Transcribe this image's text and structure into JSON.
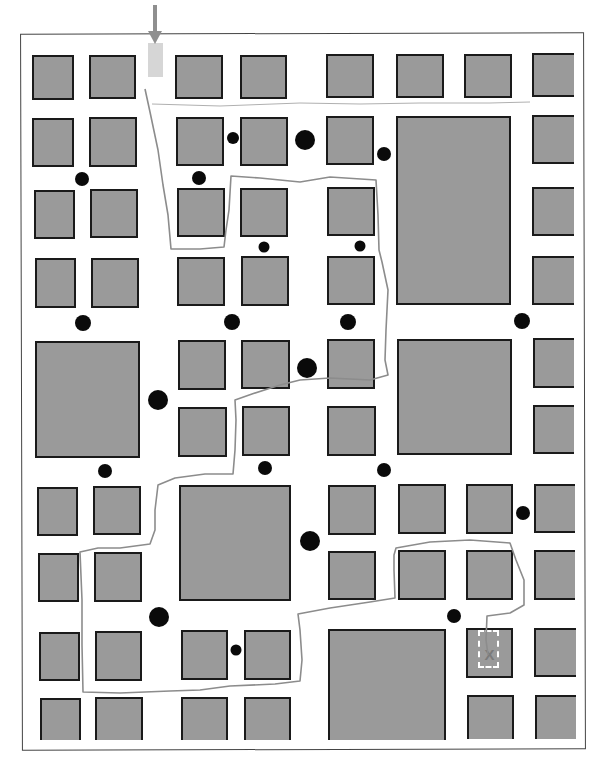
{
  "colors": {
    "block_fill": "#9a9a9a",
    "block_border": "#1a1a1a",
    "path": "#8c8c8c",
    "arrow": "#8f8f8f",
    "start_marker": "#d6d6d6",
    "dot": "#0a0a0a",
    "goal_box": "#ffffff"
  },
  "start": {
    "arrow": {
      "x": 155,
      "y_top": 5,
      "y_tip": 44
    },
    "marker": {
      "x": 148,
      "y": 43,
      "w": 15,
      "h": 34
    },
    "icon": "down-arrow-icon"
  },
  "goal": {
    "label": "X",
    "box": {
      "x": 478,
      "y": 630,
      "w": 21,
      "h": 38
    },
    "icon": "x-mark-icon"
  },
  "blocks": [
    {
      "x": 32,
      "y": 55,
      "w": 42,
      "h": 45
    },
    {
      "x": 89,
      "y": 55,
      "w": 47,
      "h": 44
    },
    {
      "x": 175,
      "y": 55,
      "w": 48,
      "h": 44
    },
    {
      "x": 240,
      "y": 55,
      "w": 47,
      "h": 44
    },
    {
      "x": 326,
      "y": 54,
      "w": 48,
      "h": 44
    },
    {
      "x": 396,
      "y": 54,
      "w": 48,
      "h": 44
    },
    {
      "x": 464,
      "y": 54,
      "w": 48,
      "h": 44
    },
    {
      "x": 532,
      "y": 53,
      "w": 42,
      "h": 44
    },
    {
      "x": 32,
      "y": 118,
      "w": 42,
      "h": 49
    },
    {
      "x": 89,
      "y": 117,
      "w": 48,
      "h": 50
    },
    {
      "x": 176,
      "y": 117,
      "w": 48,
      "h": 49
    },
    {
      "x": 240,
      "y": 117,
      "w": 48,
      "h": 49
    },
    {
      "x": 326,
      "y": 116,
      "w": 48,
      "h": 49
    },
    {
      "x": 396,
      "y": 116,
      "w": 115,
      "h": 189
    },
    {
      "x": 532,
      "y": 115,
      "w": 42,
      "h": 49
    },
    {
      "x": 34,
      "y": 190,
      "w": 41,
      "h": 49
    },
    {
      "x": 90,
      "y": 189,
      "w": 48,
      "h": 49
    },
    {
      "x": 177,
      "y": 188,
      "w": 48,
      "h": 49
    },
    {
      "x": 240,
      "y": 188,
      "w": 48,
      "h": 49
    },
    {
      "x": 327,
      "y": 187,
      "w": 48,
      "h": 49
    },
    {
      "x": 532,
      "y": 187,
      "w": 42,
      "h": 49
    },
    {
      "x": 35,
      "y": 258,
      "w": 41,
      "h": 50
    },
    {
      "x": 91,
      "y": 258,
      "w": 48,
      "h": 50
    },
    {
      "x": 177,
      "y": 257,
      "w": 48,
      "h": 49
    },
    {
      "x": 241,
      "y": 256,
      "w": 48,
      "h": 50
    },
    {
      "x": 327,
      "y": 256,
      "w": 48,
      "h": 49
    },
    {
      "x": 532,
      "y": 256,
      "w": 42,
      "h": 49
    },
    {
      "x": 35,
      "y": 341,
      "w": 105,
      "h": 117
    },
    {
      "x": 178,
      "y": 340,
      "w": 48,
      "h": 50
    },
    {
      "x": 241,
      "y": 340,
      "w": 49,
      "h": 49
    },
    {
      "x": 327,
      "y": 339,
      "w": 48,
      "h": 50
    },
    {
      "x": 397,
      "y": 339,
      "w": 115,
      "h": 116
    },
    {
      "x": 533,
      "y": 338,
      "w": 41,
      "h": 50
    },
    {
      "x": 178,
      "y": 407,
      "w": 49,
      "h": 50
    },
    {
      "x": 242,
      "y": 406,
      "w": 48,
      "h": 50
    },
    {
      "x": 327,
      "y": 406,
      "w": 49,
      "h": 50
    },
    {
      "x": 533,
      "y": 405,
      "w": 41,
      "h": 49
    },
    {
      "x": 37,
      "y": 487,
      "w": 41,
      "h": 49
    },
    {
      "x": 93,
      "y": 486,
      "w": 48,
      "h": 49
    },
    {
      "x": 179,
      "y": 485,
      "w": 112,
      "h": 116
    },
    {
      "x": 328,
      "y": 485,
      "w": 48,
      "h": 50
    },
    {
      "x": 398,
      "y": 484,
      "w": 48,
      "h": 50
    },
    {
      "x": 466,
      "y": 484,
      "w": 47,
      "h": 50
    },
    {
      "x": 534,
      "y": 484,
      "w": 41,
      "h": 49
    },
    {
      "x": 38,
      "y": 553,
      "w": 41,
      "h": 49
    },
    {
      "x": 94,
      "y": 552,
      "w": 48,
      "h": 50
    },
    {
      "x": 328,
      "y": 551,
      "w": 48,
      "h": 49
    },
    {
      "x": 398,
      "y": 550,
      "w": 48,
      "h": 50
    },
    {
      "x": 466,
      "y": 550,
      "w": 47,
      "h": 50
    },
    {
      "x": 534,
      "y": 550,
      "w": 41,
      "h": 50
    },
    {
      "x": 39,
      "y": 632,
      "w": 41,
      "h": 49
    },
    {
      "x": 95,
      "y": 631,
      "w": 47,
      "h": 50
    },
    {
      "x": 181,
      "y": 630,
      "w": 47,
      "h": 50
    },
    {
      "x": 244,
      "y": 630,
      "w": 47,
      "h": 50
    },
    {
      "x": 328,
      "y": 629,
      "w": 118,
      "h": 111
    },
    {
      "x": 466,
      "y": 628,
      "w": 47,
      "h": 50
    },
    {
      "x": 534,
      "y": 628,
      "w": 42,
      "h": 49
    },
    {
      "x": 40,
      "y": 698,
      "w": 41,
      "h": 42
    },
    {
      "x": 95,
      "y": 697,
      "w": 48,
      "h": 43
    },
    {
      "x": 181,
      "y": 697,
      "w": 47,
      "h": 43
    },
    {
      "x": 244,
      "y": 697,
      "w": 47,
      "h": 43
    },
    {
      "x": 467,
      "y": 695,
      "w": 47,
      "h": 44
    },
    {
      "x": 535,
      "y": 695,
      "w": 41,
      "h": 44
    }
  ],
  "dots": [
    {
      "x": 233,
      "y": 138,
      "r": 6
    },
    {
      "x": 305,
      "y": 140,
      "r": 10
    },
    {
      "x": 384,
      "y": 154,
      "r": 7
    },
    {
      "x": 82,
      "y": 179,
      "r": 7
    },
    {
      "x": 199,
      "y": 178,
      "r": 7
    },
    {
      "x": 264,
      "y": 247,
      "r": 5.5
    },
    {
      "x": 360,
      "y": 246,
      "r": 5.5
    },
    {
      "x": 83,
      "y": 323,
      "r": 8
    },
    {
      "x": 232,
      "y": 322,
      "r": 8
    },
    {
      "x": 348,
      "y": 322,
      "r": 8
    },
    {
      "x": 522,
      "y": 321,
      "r": 8
    },
    {
      "x": 307,
      "y": 368,
      "r": 10
    },
    {
      "x": 158,
      "y": 400,
      "r": 10
    },
    {
      "x": 105,
      "y": 471,
      "r": 7
    },
    {
      "x": 265,
      "y": 468,
      "r": 7
    },
    {
      "x": 384,
      "y": 470,
      "r": 7
    },
    {
      "x": 523,
      "y": 513,
      "r": 7
    },
    {
      "x": 310,
      "y": 541,
      "r": 10
    },
    {
      "x": 159,
      "y": 617,
      "r": 10
    },
    {
      "x": 454,
      "y": 616,
      "r": 7
    },
    {
      "x": 236,
      "y": 650,
      "r": 5.5
    }
  ],
  "path_points": [
    [
      145,
      89
    ],
    [
      150,
      112
    ],
    [
      158,
      150
    ],
    [
      163,
      185
    ],
    [
      168,
      215
    ],
    [
      171,
      249
    ],
    [
      200,
      249
    ],
    [
      224,
      247
    ],
    [
      226,
      230
    ],
    [
      229,
      210
    ],
    [
      231,
      176
    ],
    [
      260,
      178
    ],
    [
      300,
      182
    ],
    [
      330,
      177
    ],
    [
      376,
      180
    ],
    [
      378,
      215
    ],
    [
      379,
      250
    ],
    [
      382,
      262
    ],
    [
      388,
      290
    ],
    [
      386,
      330
    ],
    [
      385,
      360
    ],
    [
      388,
      375
    ],
    [
      370,
      380
    ],
    [
      330,
      378
    ],
    [
      300,
      380
    ],
    [
      280,
      385
    ],
    [
      252,
      394
    ],
    [
      235,
      400
    ],
    [
      236,
      420
    ],
    [
      235,
      450
    ],
    [
      233,
      474
    ],
    [
      205,
      474
    ],
    [
      175,
      478
    ],
    [
      158,
      485
    ],
    [
      155,
      510
    ],
    [
      155,
      530
    ],
    [
      150,
      544
    ],
    [
      120,
      548
    ],
    [
      98,
      548
    ],
    [
      80,
      552
    ],
    [
      82,
      600
    ],
    [
      82,
      645
    ],
    [
      83,
      692
    ],
    [
      120,
      693
    ],
    [
      170,
      691
    ],
    [
      200,
      690
    ],
    [
      230,
      686
    ],
    [
      275,
      684
    ],
    [
      300,
      681
    ],
    [
      302,
      660
    ],
    [
      300,
      630
    ],
    [
      298,
      614
    ],
    [
      330,
      608
    ],
    [
      370,
      602
    ],
    [
      395,
      598
    ],
    [
      394,
      570
    ],
    [
      394,
      555
    ],
    [
      396,
      548
    ],
    [
      430,
      542
    ],
    [
      470,
      540
    ],
    [
      510,
      543
    ],
    [
      516,
      560
    ],
    [
      524,
      580
    ],
    [
      524,
      605
    ],
    [
      510,
      613
    ],
    [
      487,
      616
    ],
    [
      486,
      640
    ],
    [
      488,
      655
    ]
  ],
  "top_path_line": [
    [
      152,
      104
    ],
    [
      220,
      106
    ],
    [
      300,
      103
    ],
    [
      360,
      104
    ],
    [
      420,
      103
    ],
    [
      490,
      103
    ],
    [
      530,
      102
    ]
  ]
}
